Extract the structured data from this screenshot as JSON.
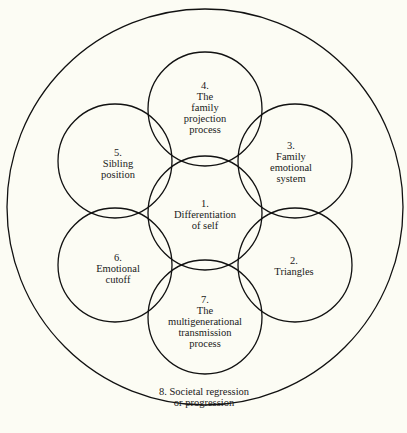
{
  "diagram": {
    "type": "bowen-family-systems-concepts",
    "background": "#fcfcf4",
    "stroke": "#111111",
    "outer": {
      "id": 8,
      "label_lines": [
        "8. Societal regression",
        "or progression"
      ],
      "cx": 205,
      "cy": 207,
      "r": 198,
      "label_x": 205,
      "label_y": 395
    },
    "circles": [
      {
        "id": 1,
        "lines": [
          "1.",
          "Differentiation",
          "of self"
        ],
        "cx": 205,
        "cy": 213,
        "r": 57
      },
      {
        "id": 2,
        "lines": [
          "2.",
          "Triangles"
        ],
        "cx": 295,
        "cy": 265,
        "r": 57
      },
      {
        "id": 3,
        "lines": [
          "3.",
          "Family",
          "emotional",
          "system"
        ],
        "cx": 295,
        "cy": 161,
        "r": 57
      },
      {
        "id": 4,
        "lines": [
          "4.",
          "The",
          "family",
          "projection",
          "process"
        ],
        "cx": 205,
        "cy": 109,
        "r": 57
      },
      {
        "id": 5,
        "lines": [
          "5.",
          "Sibling",
          "position"
        ],
        "cx": 115,
        "cy": 161,
        "r": 57
      },
      {
        "id": 6,
        "lines": [
          "6.",
          "Emotional",
          "cutoff"
        ],
        "cx": 115,
        "cy": 265,
        "r": 57
      },
      {
        "id": 7,
        "lines": [
          "7.",
          "The",
          "multigenerational",
          "transmission",
          "process"
        ],
        "cx": 205,
        "cy": 317,
        "r": 57
      }
    ]
  }
}
